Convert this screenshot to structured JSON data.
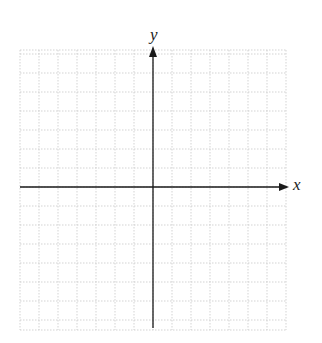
{
  "diagram": {
    "type": "coordinate-plane",
    "x_axis_label": "x",
    "y_axis_label": "y",
    "grid": {
      "cell_size_px": 19,
      "cells_left": 7,
      "cells_right": 7,
      "cells_up": 7,
      "cells_down": 7,
      "line_style": "dotted",
      "line_color": "#c8c8c8"
    },
    "axis_color": "#1a1a1a",
    "background": "#ffffff"
  }
}
